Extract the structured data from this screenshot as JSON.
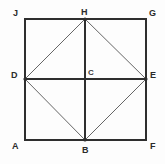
{
  "figure": {
    "background_color": "#fdfdfd",
    "stroke_color": "#2e2e2e",
    "thin_stroke_color": "#555555",
    "canvas": {
      "width": 165,
      "height": 164
    }
  },
  "geometry": {
    "square": {
      "name": "AJGF",
      "left": 25,
      "top": 19,
      "right": 146,
      "bottom": 140,
      "stroke_width": 1.4
    },
    "points": {
      "A": {
        "x": 25,
        "y": 140,
        "label": "A",
        "label_x": 12,
        "label_y": 142
      },
      "B": {
        "x": 85,
        "y": 140,
        "label": "B",
        "label_x": 82,
        "label_y": 146
      },
      "C": {
        "x": 85,
        "y": 79,
        "label": "C",
        "label_x": 88,
        "label_y": 68
      },
      "D": {
        "x": 25,
        "y": 79,
        "label": "D",
        "label_x": 11,
        "label_y": 71
      },
      "E": {
        "x": 146,
        "y": 79,
        "label": "E",
        "label_x": 150,
        "label_y": 71
      },
      "F": {
        "x": 146,
        "y": 140,
        "label": "F",
        "label_x": 150,
        "label_y": 142
      },
      "G": {
        "x": 146,
        "y": 19,
        "label": "G",
        "label_x": 149,
        "label_y": 9
      },
      "H": {
        "x": 85,
        "y": 19,
        "label": "H",
        "label_x": 81,
        "label_y": 8
      },
      "J": {
        "x": 25,
        "y": 19,
        "label": "J",
        "label_x": 13,
        "label_y": 9
      }
    },
    "segments": [
      {
        "name": "square-side-JG",
        "from": "J",
        "to": "G",
        "weight": "thick"
      },
      {
        "name": "square-side-GF",
        "from": "G",
        "to": "F",
        "weight": "thick"
      },
      {
        "name": "square-side-FA",
        "from": "F",
        "to": "A",
        "weight": "thick"
      },
      {
        "name": "square-side-AJ",
        "from": "A",
        "to": "J",
        "weight": "thick"
      },
      {
        "name": "median-horizontal-DE",
        "from": "D",
        "to": "E",
        "weight": "thick"
      },
      {
        "name": "median-vertical-HB",
        "from": "H",
        "to": "B",
        "weight": "thick"
      },
      {
        "name": "rhombus-side-DH",
        "from": "D",
        "to": "H",
        "weight": "thin"
      },
      {
        "name": "rhombus-side-HE",
        "from": "H",
        "to": "E",
        "weight": "thin"
      },
      {
        "name": "rhombus-side-EB",
        "from": "E",
        "to": "B",
        "weight": "thin"
      },
      {
        "name": "rhombus-side-BD",
        "from": "B",
        "to": "D",
        "weight": "thin"
      }
    ],
    "vertex_order": [
      "J",
      "H",
      "G",
      "D",
      "C",
      "E",
      "A",
      "B",
      "F"
    ]
  }
}
